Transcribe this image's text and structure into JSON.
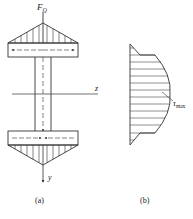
{
  "figure_a": {
    "force_label": "F",
    "force_subscript": "Q",
    "axis_z": "z",
    "axis_y": "y",
    "caption": "(a)"
  },
  "figure_b": {
    "tau_label": "τ",
    "tau_subscript": "max",
    "caption": "(b)"
  },
  "colors": {
    "stroke": "#333333",
    "background": "#ffffff"
  }
}
